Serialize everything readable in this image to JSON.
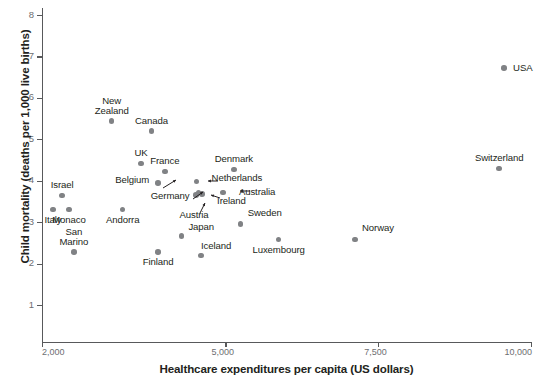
{
  "chart_data": {
    "type": "scatter",
    "title": "",
    "xlabel": "Healthcare expenditures per capita (US dollars)",
    "ylabel": "Child mortality (deaths per 1,000 live births)",
    "xlim": [
      2000,
      10000
    ],
    "ylim": [
      0.45,
      8.4
    ],
    "grid": false,
    "legend": "none",
    "xticks": [
      2000,
      5000,
      7500,
      10000
    ],
    "xtick_labels": [
      "2,000",
      "5,000",
      "7,500",
      "10,000"
    ],
    "yticks": [
      1,
      2,
      3,
      4,
      5,
      6,
      7,
      8
    ],
    "ytick_labels": [
      "1",
      "2",
      "3",
      "4",
      "5",
      "6",
      "7",
      "8"
    ],
    "point_color": "#808285",
    "axis_color": "#58595b",
    "points": [
      {
        "label": "Italy",
        "x": 2180,
        "y": 3.3,
        "label_pos": "below",
        "leader": false
      },
      {
        "label": "Monaco",
        "x": 2440,
        "y": 3.3,
        "label_pos": "below",
        "leader": false
      },
      {
        "label": "Israel",
        "x": 2330,
        "y": 3.64,
        "label_pos": "above",
        "leader": false
      },
      {
        "label": "San\nMarino",
        "x": 2520,
        "y": 2.28,
        "label_pos": "above",
        "leader": false
      },
      {
        "label": "Andorra",
        "x": 3320,
        "y": 3.3,
        "label_pos": "below",
        "leader": false
      },
      {
        "label": "New\nZealand",
        "x": 3140,
        "y": 5.44,
        "label_pos": "above",
        "leader": false
      },
      {
        "label": "Canada",
        "x": 3790,
        "y": 5.2,
        "label_pos": "above",
        "leader": false
      },
      {
        "label": "UK",
        "x": 3620,
        "y": 4.42,
        "label_pos": "above",
        "leader": false
      },
      {
        "label": "Belgium",
        "x": 3900,
        "y": 3.95,
        "label_pos": "left",
        "leader": true
      },
      {
        "label": "France",
        "x": 4010,
        "y": 4.22,
        "label_pos": "above",
        "leader": false
      },
      {
        "label": "Finland",
        "x": 3900,
        "y": 2.28,
        "label_pos": "below",
        "leader": false
      },
      {
        "label": "Japan",
        "x": 4280,
        "y": 2.66,
        "label_pos": "above-right",
        "leader": false
      },
      {
        "label": "Germany",
        "x": 4560,
        "y": 3.72,
        "label_pos": "left",
        "leader": true
      },
      {
        "label": "Austria",
        "x": 4520,
        "y": 3.66,
        "label_pos": "below",
        "leader": true
      },
      {
        "label": "Netherlands",
        "x": 4530,
        "y": 3.98,
        "label_pos": "right",
        "leader": true
      },
      {
        "label": "Ireland",
        "x": 4620,
        "y": 3.68,
        "label_pos": "right",
        "leader": true
      },
      {
        "label": "Australia",
        "x": 4960,
        "y": 3.72,
        "label_pos": "right",
        "leader": true
      },
      {
        "label": "Iceland",
        "x": 4600,
        "y": 2.2,
        "label_pos": "above-right",
        "leader": false
      },
      {
        "label": "Denmark",
        "x": 5140,
        "y": 4.27,
        "label_pos": "above",
        "leader": false
      },
      {
        "label": "Sweden",
        "x": 5250,
        "y": 2.95,
        "label_pos": "above-right",
        "leader": false
      },
      {
        "label": "Luxembourg",
        "x": 5870,
        "y": 2.58,
        "label_pos": "below",
        "leader": false
      },
      {
        "label": "Norway",
        "x": 7120,
        "y": 2.58,
        "label_pos": "above-right",
        "leader": false
      },
      {
        "label": "Switzerland",
        "x": 9480,
        "y": 4.3,
        "label_pos": "above",
        "leader": false
      },
      {
        "label": "USA",
        "x": 9560,
        "y": 6.72,
        "label_pos": "right",
        "leader": false
      }
    ]
  },
  "axes": {
    "x_title": "Healthcare expenditures per capita (US dollars)",
    "y_title": "Child mortality (deaths per 1,000 live births)"
  }
}
